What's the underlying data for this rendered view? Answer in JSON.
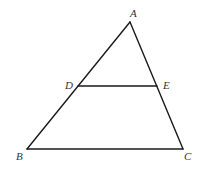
{
  "diagram": {
    "type": "geometry-triangle",
    "stroke_color": "#1a1a1a",
    "label_color": "#333333",
    "points": {
      "A": {
        "label": "A",
        "x": 130,
        "y": 22,
        "label_x": 130,
        "label_y": 17
      },
      "B": {
        "label": "B",
        "x": 27,
        "y": 149,
        "label_x": 16,
        "label_y": 160
      },
      "C": {
        "label": "C",
        "x": 183,
        "y": 149,
        "label_x": 184,
        "label_y": 160
      },
      "D": {
        "label": "D",
        "x": 78,
        "y": 86,
        "label_x": 65,
        "label_y": 89
      },
      "E": {
        "label": "E",
        "x": 157,
        "y": 86,
        "label_x": 163,
        "label_y": 89
      }
    },
    "segments": [
      {
        "name": "AB",
        "from": "A",
        "to": "B"
      },
      {
        "name": "AC",
        "from": "A",
        "to": "C"
      },
      {
        "name": "BC",
        "from": "B",
        "to": "C"
      },
      {
        "name": "DE",
        "from": "D",
        "to": "E"
      }
    ]
  }
}
